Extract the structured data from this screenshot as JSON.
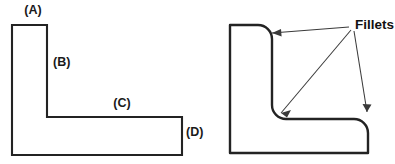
{
  "figure": {
    "background_color": "#ffffff",
    "line_color": "#232323",
    "leader_color": "#3a3a3a"
  },
  "left_figure": {
    "name": "sharp-corner-l-bracket",
    "outline_path": "M 12 25 L 47 25 L 47 117 L 182 117 L 182 155 L 12 155 Z",
    "callouts": [
      {
        "id": "a",
        "label": "(A)",
        "x": 33,
        "y": 11,
        "anchor": "middle"
      },
      {
        "id": "b",
        "label": "(B)",
        "x": 53,
        "y": 63,
        "anchor": "start"
      },
      {
        "id": "c",
        "label": "(C)",
        "x": 122,
        "y": 104,
        "anchor": "middle"
      },
      {
        "id": "d",
        "label": "(D)",
        "x": 186,
        "y": 133,
        "anchor": "start"
      }
    ]
  },
  "right_figure": {
    "name": "filleted-l-bracket",
    "outline_path": "M 230 25 L 258 25 A 14 14 0 0 1 272 39 L 272 105 A 14 14 0 0 0 286 119 L 354 119 A 14 14 0 0 1 368 133 L 368 153 L 230 153 Z",
    "label": "Fillets",
    "label_x": 355,
    "label_y": 25,
    "leaders": [
      {
        "id": "leader-top-right-fillet",
        "line": "M 349 27 L 272 33",
        "head": "M 272 33 L 281 29 L 281.6 36.6 Z"
      },
      {
        "id": "leader-inner-fillet",
        "line": "M 351 30 L 281 113",
        "head": "M 281 113 L 291 110 L 287 117.5 Z"
      },
      {
        "id": "leader-bottom-right-fillet",
        "line": "M 354 31 L 367 112",
        "head": "M 367 112 L 362.5 104 L 371.5 104.5 Z"
      }
    ]
  }
}
